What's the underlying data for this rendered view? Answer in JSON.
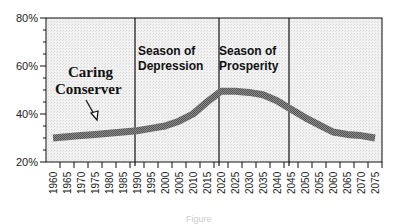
{
  "chart_data": {
    "type": "line",
    "title": "",
    "caption": "Figure",
    "xlabel": "",
    "ylabel": "",
    "ylim": [
      20,
      80
    ],
    "yticks": [
      "20%",
      "40%",
      "60%",
      "80%"
    ],
    "categories": [
      "1960",
      "1965",
      "1970",
      "1975",
      "1980",
      "1985",
      "1990",
      "1995",
      "2000",
      "2005",
      "2010",
      "2015",
      "2020",
      "2025",
      "2030",
      "2035",
      "2040",
      "2045",
      "2050",
      "2055",
      "2060",
      "2065",
      "2070",
      "2075"
    ],
    "series": [
      {
        "name": "Caring Conserver",
        "values": [
          30,
          30.5,
          31,
          31.5,
          32,
          32.5,
          33,
          34,
          35,
          37,
          40,
          45,
          49.5,
          49.5,
          49,
          48,
          45.5,
          42,
          38.5,
          35.5,
          32.5,
          31.5,
          31,
          30
        ],
        "color": "#777777"
      }
    ],
    "annotations": [
      {
        "text": "Caring Conserver",
        "type": "series-label",
        "arrow_to": "1975"
      },
      {
        "text": "Season of Depression",
        "type": "region-label",
        "from": "1990",
        "to": "2020"
      },
      {
        "text": "Season of Prosperity",
        "type": "region-label",
        "from": "2020",
        "to": "2045"
      }
    ],
    "vertical_lines": [
      "1990",
      "2020",
      "2045"
    ],
    "grid": false,
    "background": "stippled light gray"
  },
  "labels": {
    "annot_line1": "Caring",
    "annot_line2": "Conserver",
    "region1_line1": "Season of",
    "region1_line2": "Depression",
    "region2_line1": "Season of",
    "region2_line2": "Prosperity",
    "caption": "Figure"
  }
}
